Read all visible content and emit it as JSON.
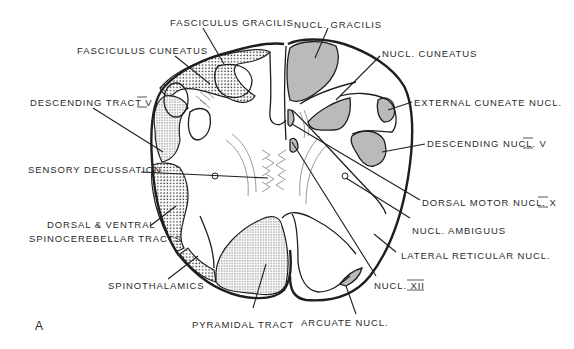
{
  "figure": {
    "panel_letter": "A",
    "colors": {
      "ink": "#1e1e1e",
      "nucleus_fill": "#bdbdbd",
      "tract_stipple": "#1e1e1e",
      "background": "#ffffff"
    },
    "labels_left": [
      {
        "id": "fasciculus-gracilis",
        "text": "FASCICULUS  GRACILIS"
      },
      {
        "id": "fasciculus-cuneatus",
        "text": "FASCICULUS  CUNEATUS"
      },
      {
        "id": "descending-tract-v",
        "text": "DESCENDING  TRACT  V"
      },
      {
        "id": "sensory-decussation",
        "text": "SENSORY DECUSSATION"
      },
      {
        "id": "dorsal-ventral-spinocerebellar-1",
        "text": "DORSAL & VENTRAL"
      },
      {
        "id": "dorsal-ventral-spinocerebellar-2",
        "text": "SPINOCEREBELLAR TRACTS"
      },
      {
        "id": "spinothalamics",
        "text": "SPINOTHALAMICS"
      },
      {
        "id": "pyramidal-tract",
        "text": "PYRAMIDAL  TRACT"
      }
    ],
    "labels_right": [
      {
        "id": "nucl-gracilis",
        "text": "NUCL. GRACILIS"
      },
      {
        "id": "nucl-cuneatus",
        "text": "NUCL. CUNEATUS"
      },
      {
        "id": "external-cuneate-nucl",
        "text": "EXTERNAL  CUNEATE  NUCL."
      },
      {
        "id": "descending-nucl-v",
        "text": "DESCENDING  NUCL.  V"
      },
      {
        "id": "dorsal-motor-nucl-x",
        "text": "DORSAL MOTOR  NUCL.  X"
      },
      {
        "id": "nucl-ambiguus",
        "text": "NUCL. AMBIGUUS"
      },
      {
        "id": "lateral-reticular-nucl",
        "text": "LATERAL  RETICULAR  NUCL."
      },
      {
        "id": "nucl-xii",
        "text": "NUCL.  XII"
      },
      {
        "id": "arcuate-nucl",
        "text": "ARCUATE  NUCL."
      }
    ]
  }
}
